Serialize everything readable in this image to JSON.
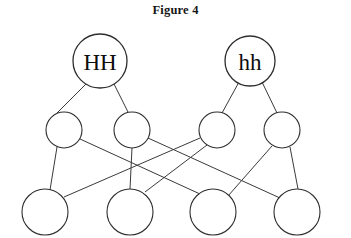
{
  "figure": {
    "title": "Figure 4",
    "type": "pedigree-inheritance-diagram",
    "canvas": {
      "width": 351,
      "height": 238,
      "background": "#ffffff"
    },
    "line_color": "#3a3a3a",
    "node_stroke_color": "#2e2e2e",
    "node_fill_color": "#ffffff",
    "text_color": "#0d0d0d"
  },
  "generations": [
    {
      "name": "parental-generation",
      "row": 1,
      "nodes": [
        {
          "id": "P1",
          "label": "HH",
          "cx": 100,
          "cy": 61,
          "r": 27,
          "labeled": true
        },
        {
          "id": "P2",
          "label": "hh",
          "cx": 250,
          "cy": 61,
          "r": 25,
          "labeled": true
        }
      ]
    },
    {
      "name": "f1-generation",
      "row": 2,
      "nodes": [
        {
          "id": "F1a",
          "label": "",
          "cx": 64,
          "cy": 130,
          "r": 18,
          "labeled": false
        },
        {
          "id": "F1b",
          "label": "",
          "cx": 132,
          "cy": 130,
          "r": 18,
          "labeled": false
        },
        {
          "id": "F1c",
          "label": "",
          "cx": 217,
          "cy": 130,
          "r": 18,
          "labeled": false
        },
        {
          "id": "F1d",
          "label": "",
          "cx": 282,
          "cy": 130,
          "r": 18,
          "labeled": false
        }
      ]
    },
    {
      "name": "f2-generation",
      "row": 3,
      "nodes": [
        {
          "id": "F2a",
          "label": "",
          "cx": 45,
          "cy": 212,
          "r": 23,
          "labeled": false
        },
        {
          "id": "F2b",
          "label": "",
          "cx": 130,
          "cy": 212,
          "r": 23,
          "labeled": false
        },
        {
          "id": "F2c",
          "label": "",
          "cx": 213,
          "cy": 212,
          "r": 23,
          "labeled": false
        },
        {
          "id": "F2d",
          "label": "",
          "cx": 297,
          "cy": 212,
          "r": 23,
          "labeled": false
        }
      ]
    }
  ],
  "edges": [
    {
      "id": "e1",
      "from": "P1",
      "to": "F1a",
      "x1": 86,
      "y1": 84,
      "x2": 57,
      "y2": 113
    },
    {
      "id": "e2",
      "from": "P1",
      "to": "F1b",
      "x1": 114,
      "y1": 84,
      "x2": 128,
      "y2": 112
    },
    {
      "id": "e3",
      "from": "P2",
      "to": "F1c",
      "x1": 239,
      "y1": 82,
      "x2": 222,
      "y2": 113
    },
    {
      "id": "e4",
      "from": "P2",
      "to": "F1d",
      "x1": 262,
      "y1": 82,
      "x2": 277,
      "y2": 113
    },
    {
      "id": "e5",
      "from": "F1a",
      "to": "F2a",
      "x1": 57,
      "y1": 147,
      "x2": 50,
      "y2": 190
    },
    {
      "id": "e6",
      "from": "F1a",
      "to": "F2c",
      "x1": 80,
      "y1": 139,
      "x2": 200,
      "y2": 194
    },
    {
      "id": "e7",
      "from": "F1b",
      "to": "F2b",
      "x1": 132,
      "y1": 148,
      "x2": 130,
      "y2": 189
    },
    {
      "id": "e8",
      "from": "F1b",
      "to": "F2d",
      "x1": 148,
      "y1": 138,
      "x2": 280,
      "y2": 198
    },
    {
      "id": "e9",
      "from": "F1c",
      "to": "F2a",
      "x1": 200,
      "y1": 138,
      "x2": 64,
      "y2": 197
    },
    {
      "id": "e10",
      "from": "F1c",
      "to": "F2b",
      "x1": 207,
      "y1": 145,
      "x2": 145,
      "y2": 192
    },
    {
      "id": "e11",
      "from": "F1d",
      "to": "F2c",
      "x1": 272,
      "y1": 146,
      "x2": 228,
      "y2": 196
    },
    {
      "id": "e12",
      "from": "F1d",
      "to": "F2d",
      "x1": 290,
      "y1": 147,
      "x2": 298,
      "y2": 189
    }
  ]
}
